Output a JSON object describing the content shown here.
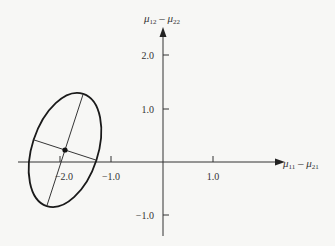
{
  "diagram": {
    "type": "confidence-ellipse",
    "x_axis": {
      "label_main": "μ",
      "label_sub1": "11",
      "label_mid": " – μ",
      "label_sub2": "21",
      "ticks": [
        {
          "value": -2.0,
          "label": "−2.0"
        },
        {
          "value": -1.0,
          "label": "−1.0"
        },
        {
          "value": 1.0,
          "label": "1.0"
        }
      ]
    },
    "y_axis": {
      "label_main": "μ",
      "label_sub1": "12",
      "label_mid": " – μ",
      "label_sub2": "22",
      "ticks": [
        {
          "value": 2.0,
          "label": "2.0"
        },
        {
          "value": 1.0,
          "label": "1.0"
        },
        {
          "value": -1.0,
          "label": "−1.0"
        }
      ]
    },
    "ellipse": {
      "center": [
        -1.9,
        0.22
      ],
      "major_semi_axis_px": 59,
      "minor_semi_axis_px": 33,
      "rotation_deg": -72
    },
    "colors": {
      "background": "#f7f7f5",
      "ink": "#222222"
    }
  }
}
